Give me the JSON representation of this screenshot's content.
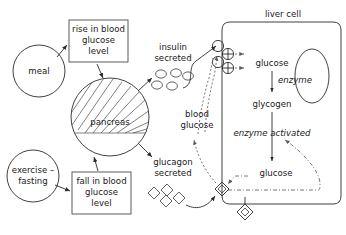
{
  "diagram": {
    "nodes": {
      "meal": "meal",
      "rise_box_line1": "rise in blood",
      "rise_box_line2": "glucose",
      "rise_box_line3": "level",
      "pancreas": "pancreas",
      "exercise_line1": "exercise –",
      "exercise_line2": "fasting",
      "fall_box_line1": "fall in blood",
      "fall_box_line2": "glucose",
      "fall_box_line3": "level",
      "insulin_line1": "insulin",
      "insulin_line2": "secreted",
      "glucagon_line1": "glucagon",
      "glucagon_line2": "secreted",
      "blood_glucose_line1": "blood",
      "blood_glucose_line2": "glucose",
      "liver_cell": "liver cell",
      "glucose_top": "glucose",
      "enzyme": "enzyme",
      "glycogen": "glycogen",
      "enzyme_activated": "enzyme activated",
      "glucose_bottom": "glucose"
    },
    "colors": {
      "ink": "#1a1a1a",
      "line": "#2b2b2b",
      "box_outline": "#4a4a4a",
      "dotted": "#6a6a6a",
      "background": "#ffffff"
    },
    "symbols": {
      "insulin_molecule": "small-circle",
      "glucagon_molecule": "small-diamond",
      "insulin_receptor": "circle-receptor",
      "glucagon_receptor": "diamond-receptor",
      "transporter": "crossed-circle"
    },
    "counts": {
      "insulin_molecules": 5,
      "glucagon_molecules": 4,
      "insulin_receptors": 2,
      "transporters": 2,
      "glucagon_receptors": 2
    }
  }
}
